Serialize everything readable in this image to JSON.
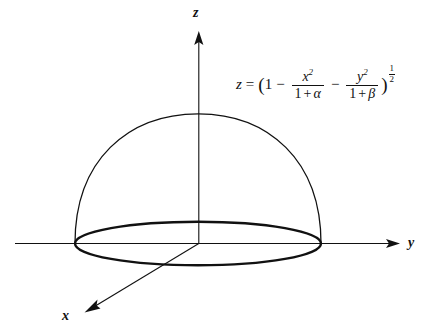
{
  "figure": {
    "background_color": "#ffffff",
    "stroke_color": "#111111"
  },
  "axes": [
    {
      "id": "z",
      "label": "z",
      "direction": "up"
    },
    {
      "id": "y",
      "label": "y",
      "direction": "right"
    },
    {
      "id": "x",
      "label": "x",
      "direction": "down-left"
    }
  ],
  "equation": {
    "lhs": "z",
    "equals": "=",
    "open_paren": "(",
    "one": "1",
    "minus_1": "−",
    "frac1": {
      "numerator_base": "x",
      "numerator_exp": "2",
      "denominator_one": "1",
      "denominator_plus": "+",
      "denominator_var": "α"
    },
    "minus_2": "−",
    "frac2": {
      "numerator_base": "y",
      "numerator_exp": "2",
      "denominator_one": "1",
      "denominator_plus": "+",
      "denominator_var": "β"
    },
    "close_paren": ")",
    "exponent": {
      "numerator": "1",
      "denominator": "2"
    },
    "plain_text": "z = (1 - x^2/(1+α) - y^2/(1+β))^(1/2)"
  },
  "surface": {
    "name": "hemisphere-dome",
    "apex_label": "",
    "base_label": "",
    "base_ellipse": {
      "cx": 198,
      "cy": 243,
      "rx": 123,
      "ry": 22
    },
    "dome_span": {
      "left_x": 75,
      "right_x": 321,
      "apex_y": 114
    }
  }
}
